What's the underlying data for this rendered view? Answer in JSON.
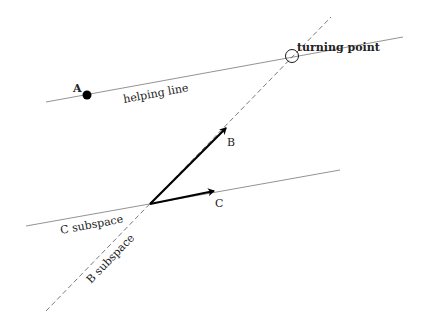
{
  "diagram": {
    "points": {
      "A": {
        "label": "A",
        "x": 87,
        "y": 95
      },
      "origin": {
        "x": 150,
        "y": 204
      },
      "turning_point": {
        "label": "turning point",
        "x": 292,
        "y": 56
      }
    },
    "vectors": {
      "B": {
        "label": "B",
        "from": [
          150,
          204
        ],
        "to": [
          227,
          127
        ]
      },
      "C": {
        "label": "C",
        "from": [
          150,
          204
        ],
        "to": [
          215,
          191
        ]
      }
    },
    "lines": {
      "helping_line": {
        "label": "helping line",
        "from": [
          46,
          102
        ],
        "to": [
          403,
          37
        ]
      },
      "c_subspace": {
        "label": "C subspace",
        "from": [
          26,
          226
        ],
        "to": [
          340,
          170
        ]
      },
      "b_subspace": {
        "label": "B subspace",
        "from": [
          46,
          311
        ],
        "to": [
          331,
          17
        ],
        "style": "dashed"
      }
    },
    "colors": {
      "line": "#777777",
      "vector": "#000000",
      "text": "#222222"
    }
  }
}
